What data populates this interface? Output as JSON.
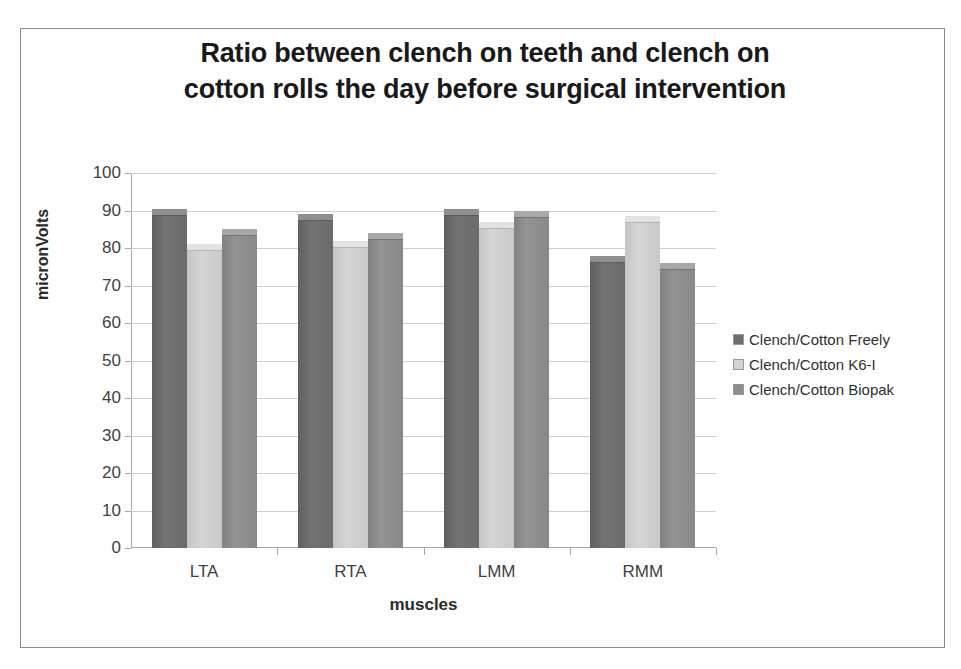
{
  "chart_data": {
    "type": "bar",
    "title": "Ratio between clench on teeth and clench on cotton rolls the day before surgical intervention",
    "title_lines": [
      "Ratio between clench on teeth and clench on",
      "cotton rolls the day before surgical intervention"
    ],
    "xlabel": "muscles",
    "ylabel": "micronVolts",
    "categories": [
      "LTA",
      "RTA",
      "LMM",
      "RMM"
    ],
    "ylim": [
      0,
      100
    ],
    "ytick_step": 10,
    "yticks": [
      0,
      10,
      20,
      30,
      40,
      50,
      60,
      70,
      80,
      90,
      100
    ],
    "ytick_labels": [
      "0",
      "10",
      "20",
      "30",
      "40",
      "50",
      "60",
      "70",
      "80",
      "90",
      "100"
    ],
    "grid": true,
    "legend_position": "right",
    "series": [
      {
        "name": "Clench/Cotton Freely",
        "color": "#6e6e6e",
        "values": [
          90.5,
          89,
          90.5,
          78
        ]
      },
      {
        "name": "Clench/Cotton K6-I",
        "color": "#d2d2d2",
        "values": [
          81,
          82,
          87,
          88.5
        ]
      },
      {
        "name": "Clench/Cotton Biopak",
        "color": "#8d8d8d",
        "values": [
          85,
          84,
          90,
          76
        ]
      }
    ]
  }
}
